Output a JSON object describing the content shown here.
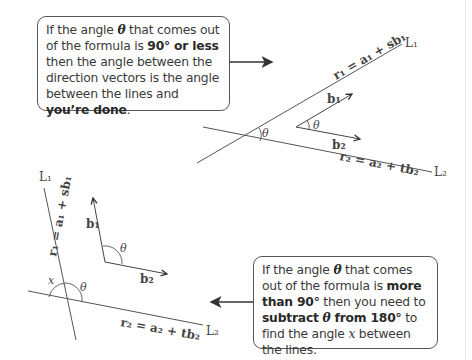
{
  "top_note": {
    "p1": "If the angle ",
    "theta": "θ",
    "p2": " that comes out of the formula is ",
    "b1": "90° or less",
    "p3": " then the angle between the direction vectors is the angle between the lines and ",
    "b2": "you’re done",
    "p4": "."
  },
  "bottom_note": {
    "p1": "If the angle ",
    "theta": "θ",
    "p2": " that comes out of the formula is ",
    "b1": "more than 90°",
    "p3": " then you need to ",
    "b2": "subtract",
    "b3": " from 180°",
    "p4": " to find the angle ",
    "x": "x",
    "p5": " between the lines."
  },
  "diagram_top": {
    "line1_label": "L₁",
    "line2_label": "L₂",
    "line1_eq": "r₁ = a₁ + sb₁",
    "line2_eq": "r₂ = a₂ + tb₂",
    "vec1": "b₁",
    "vec2": "b₂",
    "angle": "θ"
  },
  "diagram_bottom": {
    "line1_label": "L₁",
    "line2_label": "L₂",
    "line1_eq": "r₁ = a₁ + sb₁",
    "line2_eq": "r₂ = a₂ + tb₂",
    "vec1": "b₁",
    "vec2": "b₂",
    "angle": "θ",
    "supp_angle": "x"
  },
  "colors": {
    "line": "#555555",
    "text": "#3a3a3a",
    "border": "#555555"
  }
}
